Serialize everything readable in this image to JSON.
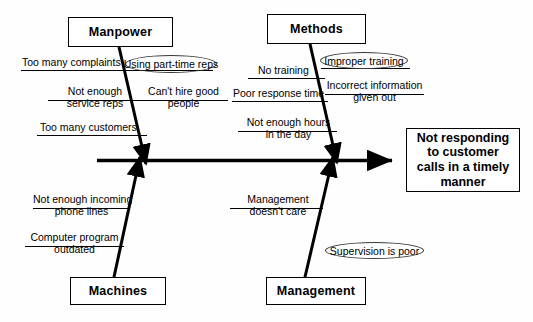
{
  "diagram": {
    "type": "fishbone-cause-and-effect",
    "effect": {
      "label": "Not responding to customer calls in a timely manner",
      "line1": "Not responding",
      "line2": "to customer",
      "line3": "calls in a timely",
      "line4": "manner"
    },
    "categories": [
      {
        "id": "manpower",
        "label": "Manpower",
        "position": "top-left"
      },
      {
        "id": "methods",
        "label": "Methods",
        "position": "top-right"
      },
      {
        "id": "machines",
        "label": "Machines",
        "position": "bottom-left"
      },
      {
        "id": "management",
        "label": "Management",
        "position": "bottom-right"
      }
    ],
    "causes": {
      "manpower": [
        {
          "id": "too-many-complaints",
          "line1": "Too many complaints",
          "line2": "",
          "circled": false
        },
        {
          "id": "using-part-time-reps",
          "line1": "Using part-time reps",
          "line2": "",
          "circled": true
        },
        {
          "id": "not-enough-service-reps",
          "line1": "Not enough",
          "line2": "service reps",
          "circled": false
        },
        {
          "id": "cant-hire-good-people",
          "line1": "Can't hire good",
          "line2": "people",
          "circled": false
        },
        {
          "id": "too-many-customers",
          "line1": "Too many customers",
          "line2": "",
          "circled": false
        }
      ],
      "methods": [
        {
          "id": "no-training",
          "line1": "No training",
          "line2": "",
          "circled": false
        },
        {
          "id": "improper-training",
          "line1": "Improper training",
          "line2": "",
          "circled": true
        },
        {
          "id": "poor-response-time",
          "line1": "Poor response time",
          "line2": "",
          "circled": false
        },
        {
          "id": "incorrect-information-given-out",
          "line1": "Incorrect information",
          "line2": "given out",
          "circled": false
        },
        {
          "id": "not-enough-hours-in-the-day",
          "line1": "Not enough hours",
          "line2": "in the day",
          "circled": false
        }
      ],
      "machines": [
        {
          "id": "not-enough-incoming-phone-lines",
          "line1": "Not enough incoming",
          "line2": "phone lines",
          "circled": false
        },
        {
          "id": "computer-program-outdated",
          "line1": "Computer program",
          "line2": "outdated",
          "circled": false
        }
      ],
      "management": [
        {
          "id": "management-doesnt-care",
          "line1": "Management",
          "line2": "doesn't care",
          "circled": false
        },
        {
          "id": "supervision-is-poor",
          "line1": "Supervision is poor",
          "line2": "",
          "circled": true
        }
      ]
    },
    "colors": {
      "ink": "#000000",
      "background": "#fefefe",
      "ellipse_stroke": "#3a3a3a"
    }
  }
}
